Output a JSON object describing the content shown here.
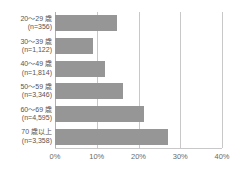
{
  "chart_data": {
    "type": "bar",
    "orientation": "horizontal",
    "title": "",
    "xlabel": "",
    "ylabel": "",
    "categories": [
      "20〜29 歳\n(n=356)",
      "30〜39 歳\n(n=1,122)",
      "40〜49 歳\n(n=1,814)",
      "50〜59 歳\n(n=3,346)",
      "60〜69 歳\n(n=4,595)",
      "70 歳以上\n(n=3,358)"
    ],
    "values": [
      14.9,
      9.2,
      12.0,
      16.4,
      21.2,
      27.0
    ],
    "xlim": [
      0,
      40
    ],
    "xticks": [
      0,
      10,
      20,
      30,
      40
    ],
    "xtick_labels": [
      "0%",
      "10%",
      "20%",
      "30%",
      "40%"
    ],
    "grid": true,
    "legend": false,
    "bar_color": "#969696",
    "gridline_color": "#c8c8c8"
  },
  "rows": [
    {
      "age_line": "20〜29 歳",
      "n_line": "(n=356)",
      "value": 14.9
    },
    {
      "age_line": "30〜39 歳",
      "n_line": "(n=1,122)",
      "value": 9.2
    },
    {
      "age_line": "40〜49 歳",
      "n_line": "(n=1,814)",
      "value": 12.0
    },
    {
      "age_line": "50〜59 歳",
      "n_line": "(n=3,346)",
      "value": 16.4
    },
    {
      "age_line": "60〜69 歳",
      "n_line": "(n=4,595)",
      "value": 21.2
    },
    {
      "age_line": "70 歳以上",
      "n_line": "(n=3,358)",
      "value": 27.0
    }
  ],
  "clipped_title": ""
}
